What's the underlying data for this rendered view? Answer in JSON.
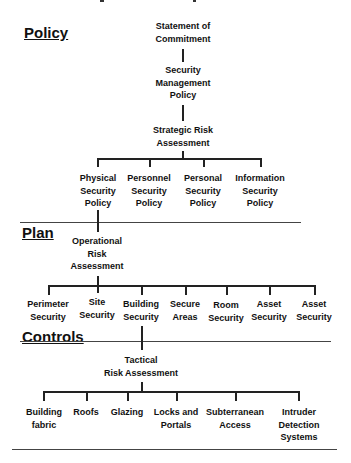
{
  "sections": {
    "policy": "Policy",
    "plan": "Plan",
    "controls": "Controls"
  },
  "policy_tier": {
    "top": [
      "Statement of",
      "Commitment"
    ],
    "management": [
      "Security",
      "Management",
      "Policy"
    ],
    "strategic": [
      "Strategic Risk",
      "Assessment"
    ],
    "children": [
      [
        "Physical",
        "Security",
        "Policy"
      ],
      [
        "Personnel",
        "Security",
        "Policy"
      ],
      [
        "Personal",
        "Security",
        "Policy"
      ],
      [
        "Information",
        "Security",
        "Policy"
      ]
    ]
  },
  "plan_tier": {
    "operational": [
      "Operational",
      "Risk",
      "Assessment"
    ],
    "children": [
      [
        "Perimeter",
        "Security"
      ],
      [
        "Site",
        "Security"
      ],
      [
        "Building",
        "Security"
      ],
      [
        "Secure",
        "Areas"
      ],
      [
        "Room",
        "Security"
      ],
      [
        "Asset",
        "Security"
      ],
      [
        "Asset",
        "Security"
      ]
    ]
  },
  "controls_tier": {
    "tactical": [
      "Tactical",
      "Risk Assessment"
    ],
    "children": [
      [
        "Building",
        "fabric"
      ],
      [
        "Roofs"
      ],
      [
        "Glazing"
      ],
      [
        "Locks and",
        "Portals"
      ],
      [
        "Subterranean",
        "Access"
      ],
      [
        "Intruder",
        "Detection",
        "Systems"
      ]
    ]
  }
}
